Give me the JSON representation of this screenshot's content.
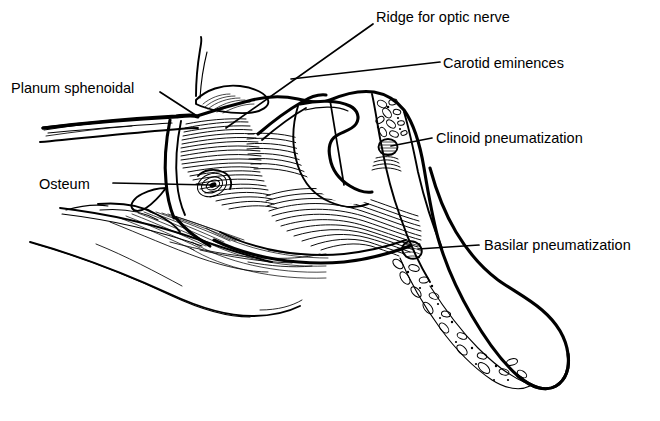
{
  "figure": {
    "background_color": "#ffffff",
    "ink_color": "#000000",
    "style": "black-and-white pen-and-ink line drawing with hatched shading",
    "width": 660,
    "height": 421
  },
  "annotations": [
    {
      "id": "ridge-for-optic-nerve",
      "label": "Ridge for optic nerve",
      "text_x": 376,
      "text_y": 22,
      "anchor": "start",
      "leader": "M 373 24 L 226 128",
      "target_x": 226,
      "target_y": 128
    },
    {
      "id": "carotid-eminences",
      "label": "Carotid eminences",
      "text_x": 443,
      "text_y": 68,
      "anchor": "start",
      "leader": "M 440 62 L 291 79",
      "target_x": 291,
      "target_y": 79
    },
    {
      "id": "carotid-eminences-branch",
      "label": "",
      "text_x": 0,
      "text_y": 0,
      "anchor": "start",
      "leader": "M 330 100 L 344 185",
      "target_x": 344,
      "target_y": 185
    },
    {
      "id": "planum-sphenoidal",
      "label": "Planum sphenoidal",
      "text_x": 11,
      "text_y": 93,
      "anchor": "start",
      "leader": "M 160 92 L 197 116",
      "target_x": 197,
      "target_y": 116
    },
    {
      "id": "clinoid-pneumatization",
      "label": "Clinoid pneumatization",
      "text_x": 436,
      "text_y": 143,
      "anchor": "start",
      "leader": "M 432 138 L 391 146",
      "target_x": 391,
      "target_y": 146
    },
    {
      "id": "osteum",
      "label": "Osteum",
      "text_x": 39,
      "text_y": 189,
      "anchor": "start",
      "leader": "M 113 183 L 211 185",
      "target_x": 211,
      "target_y": 185
    },
    {
      "id": "basilar-pneumatization",
      "label": "Basilar pneumatization",
      "text_x": 484,
      "text_y": 250,
      "anchor": "start",
      "leader": "M 479 245 L 418 249",
      "target_x": 418,
      "target_y": 249
    }
  ]
}
